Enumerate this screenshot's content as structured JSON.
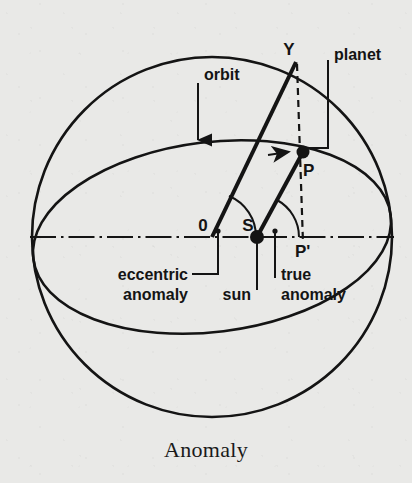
{
  "figure": {
    "caption": "Anomaly",
    "title": "Anomaly",
    "background_color": "#e9e9e7",
    "ink_color": "#141414"
  },
  "labels": {
    "orbit": "orbit",
    "planet": "planet",
    "sun": "sun",
    "eccentric_anomaly_line1": "eccentric",
    "eccentric_anomaly_line2": "anomaly",
    "true_anomaly_line1": "true",
    "true_anomaly_line2": "anomaly"
  },
  "points": {
    "center": "0",
    "sun": "S",
    "planet": "P",
    "projection": "P'",
    "circle_point": "Y"
  },
  "geometry": {
    "circle": {
      "cx": 212,
      "cy": 237,
      "r": 180
    },
    "ellipse": {
      "cx": 212,
      "cy": 237,
      "rx": 180,
      "ry": 95,
      "rotation_deg": -7
    },
    "major_axis": {
      "x1": 30,
      "y1": 237,
      "x2": 394,
      "y2": 237
    },
    "point_O": {
      "x": 212,
      "y": 237
    },
    "point_S": {
      "x": 257,
      "y": 237
    },
    "point_P": {
      "x": 303,
      "y": 152
    },
    "point_P_prime": {
      "x": 303,
      "y": 237
    },
    "point_Y": {
      "x": 296,
      "y": 62
    },
    "eccentric_anomaly_deg": 67,
    "true_anomaly_deg": 62
  }
}
